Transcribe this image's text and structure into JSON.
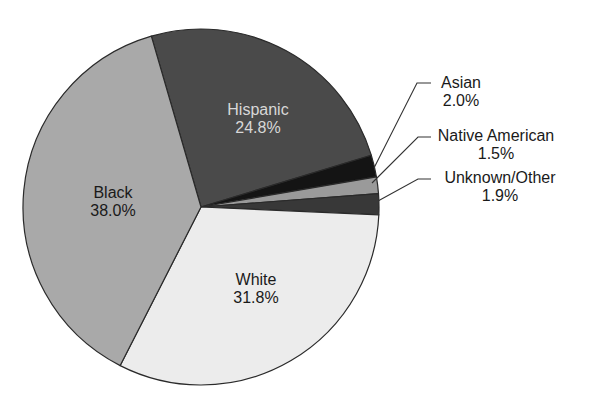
{
  "chart_data": {
    "type": "pie",
    "title": "",
    "start_angle_deg": -106.2,
    "direction": "clockwise",
    "slices": [
      {
        "label": "Hispanic",
        "value": 24.8,
        "value_label": "24.8%",
        "color": "#4a4a4a",
        "text_color": "#d8d8d8",
        "label_position": "inside"
      },
      {
        "label": "Asian",
        "value": 2.0,
        "value_label": "2.0%",
        "color": "#141414",
        "text_color": "#1a1a1a",
        "label_position": "outside"
      },
      {
        "label": "Native American",
        "value": 1.5,
        "value_label": "1.5%",
        "color": "#9a9a9a",
        "text_color": "#1a1a1a",
        "label_position": "outside"
      },
      {
        "label": "Unknown/Other",
        "value": 1.9,
        "value_label": "1.9%",
        "color": "#383838",
        "text_color": "#1a1a1a",
        "label_position": "outside"
      },
      {
        "label": "White",
        "value": 31.8,
        "value_label": "31.8%",
        "color": "#ececec",
        "text_color": "#1a1a1a",
        "label_position": "inside"
      },
      {
        "label": "Black",
        "value": 38.0,
        "value_label": "38.0%",
        "color": "#a9a9a9",
        "text_color": "#1a1a1a",
        "label_position": "inside"
      }
    ],
    "legend": "none",
    "outline_color": "#2a2a2a"
  },
  "layout": {
    "center": [
      201,
      207
    ],
    "radius": 178,
    "inside_labels": [
      {
        "slice": 0,
        "x": 258,
        "y": 115
      },
      {
        "slice": 4,
        "x": 256,
        "y": 285
      },
      {
        "slice": 5,
        "x": 113,
        "y": 198
      }
    ],
    "outside_labels": [
      {
        "slice": 1,
        "text_x": 461,
        "text_y": 88,
        "elbow": [
          417,
          83
        ],
        "end": [
          431,
          83
        ],
        "tip": [
          374,
          168
        ]
      },
      {
        "slice": 2,
        "text_x": 496,
        "text_y": 141,
        "elbow": [
          418,
          137
        ],
        "end": [
          431,
          137
        ],
        "tip": [
          372,
          183
        ]
      },
      {
        "slice": 3,
        "text_x": 500,
        "text_y": 183,
        "elbow": [
          418,
          179
        ],
        "end": [
          431,
          179
        ],
        "tip": [
          378,
          201
        ]
      }
    ]
  }
}
